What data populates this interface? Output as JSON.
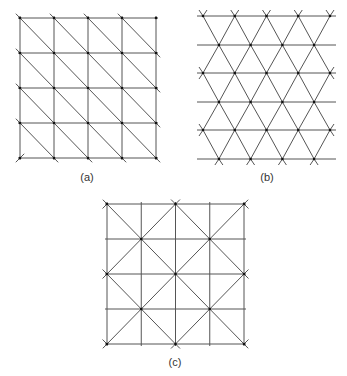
{
  "figure": {
    "panels": [
      {
        "id": "a",
        "caption": "(a)",
        "description": "Square grid 4x4 cells with one diagonal per cell (lower-left to upper-right)",
        "grid": {
          "x0": 20,
          "y0": 18,
          "x1": 156,
          "y1": 158,
          "cols": 4,
          "rows": 4
        },
        "caption_pos": {
          "x": 87,
          "y": 172
        }
      },
      {
        "id": "b",
        "caption": "(b)",
        "description": "Equilateral triangular lattice, 6 horizontal rows with alternating half-offset vertices",
        "lattice": {
          "row_y": [
            16,
            45,
            73,
            102,
            130,
            159
          ],
          "even_x": [
            203,
            234.75,
            266.5,
            298.25,
            330
          ],
          "odd_x": [
            218.9,
            250.6,
            282.4,
            314.1
          ],
          "line_x0": 197,
          "line_x1": 336
        },
        "caption_pos": {
          "x": 267,
          "y": 172
        }
      },
      {
        "id": "c",
        "caption": "(c)",
        "description": "Square grid 4x4 cells with union-jack diagonals (X pattern in every 2x2 block)",
        "grid": {
          "x0": 107,
          "y0": 204,
          "x1": 244,
          "y1": 344,
          "cols": 4,
          "rows": 4
        },
        "caption_pos": {
          "x": 175,
          "y": 357
        }
      }
    ],
    "style": {
      "line_color": "#555555",
      "node_color": "#111111",
      "caption_color": "#333333"
    }
  }
}
